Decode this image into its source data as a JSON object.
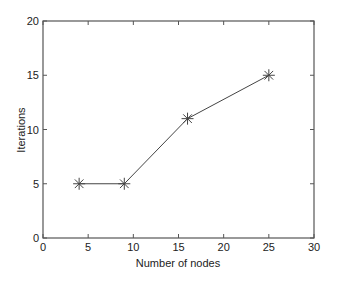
{
  "chart_data": {
    "type": "line",
    "title": "",
    "xlabel": "Number of nodes",
    "ylabel": "Iterations",
    "xlim": [
      0,
      30
    ],
    "ylim": [
      0,
      20
    ],
    "xticks": [
      0,
      5,
      10,
      15,
      20,
      25,
      30
    ],
    "yticks": [
      0,
      5,
      10,
      15,
      20
    ],
    "xtick_labels": [
      "0",
      "5",
      "10",
      "15",
      "20",
      "25",
      "30"
    ],
    "ytick_labels": [
      "0",
      "5",
      "10",
      "15",
      "20"
    ],
    "grid": false,
    "legend": null,
    "marker": "asterisk",
    "series": [
      {
        "name": "Iterations",
        "x": [
          4,
          9,
          16,
          25
        ],
        "y": [
          5,
          5,
          11,
          15
        ],
        "color": "#444444"
      }
    ]
  },
  "colors": {
    "axis": "#555555",
    "line": "#444444",
    "text": "#222222",
    "background": "#ffffff"
  },
  "layout": {
    "plot_left": 43,
    "plot_right": 314,
    "plot_top": 21,
    "plot_bottom": 238
  }
}
